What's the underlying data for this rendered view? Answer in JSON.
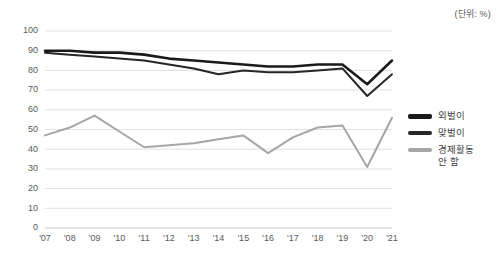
{
  "unit_note": "(단위: %)",
  "legend": {
    "items": [
      {
        "label": "외벌이",
        "color": "#1a1a1a"
      },
      {
        "label": "맞벌이",
        "color": "#262626"
      },
      {
        "label": "경제활동\n안 함",
        "color": "#a6a6a6"
      }
    ]
  },
  "chart_data": {
    "type": "line",
    "title": "",
    "subtitle": "",
    "xlabel": "",
    "ylabel": "",
    "unit": "(단위: %)",
    "ylim": [
      0,
      100
    ],
    "ytick_step": 10,
    "yticks": [
      0,
      10,
      20,
      30,
      40,
      50,
      60,
      70,
      80,
      90,
      100
    ],
    "grid": true,
    "legend_position": "right",
    "categories": [
      "'07",
      "'08",
      "'09",
      "'10",
      "'11",
      "'12",
      "'13",
      "'14",
      "'15",
      "'16",
      "'17",
      "'18",
      "'19",
      "'20",
      "'21"
    ],
    "series": [
      {
        "name": "외벌이",
        "color": "#1a1a1a",
        "width": 2.6,
        "values": [
          90,
          90,
          89,
          89,
          88,
          86,
          85,
          84,
          83,
          82,
          82,
          83,
          83,
          73,
          85
        ]
      },
      {
        "name": "맞벌이",
        "color": "#262626",
        "width": 2.0,
        "values": [
          89,
          88,
          87,
          86,
          85,
          83,
          81,
          78,
          80,
          79,
          79,
          80,
          81,
          67,
          78
        ]
      },
      {
        "name": "경제활동 안 함",
        "color": "#a6a6a6",
        "width": 2.0,
        "values": [
          47,
          51,
          57,
          49,
          41,
          42,
          43,
          45,
          47,
          38,
          46,
          51,
          52,
          31,
          56
        ]
      }
    ]
  }
}
